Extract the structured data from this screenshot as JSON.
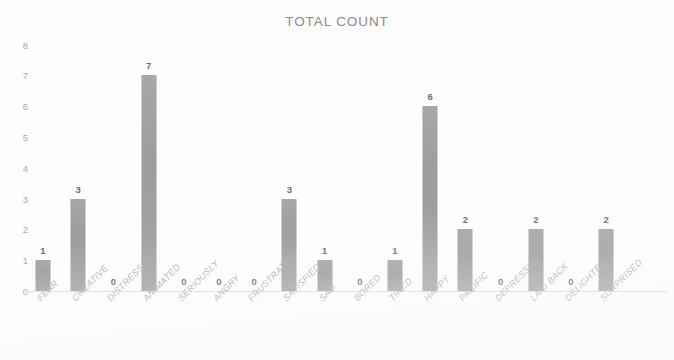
{
  "chart_data": {
    "type": "bar",
    "title": "TOTAL COUNT",
    "xlabel": "",
    "ylabel": "",
    "ylim": [
      0,
      8
    ],
    "yticks": [
      "0",
      "1",
      "2",
      "3",
      "4",
      "5",
      "6",
      "7",
      "8"
    ],
    "grid": false,
    "legend": "none",
    "bar_color": "#a2a2a2",
    "title_color": "#8a8a8a",
    "categories": [
      "FEAR",
      "CREATIVE",
      "DISTRESSED",
      "ANIMATED",
      "SERIOUSLY",
      "ANGRY",
      "FRUSTRATED",
      "SATISFIED",
      "SAD",
      "BORED",
      "TIRED",
      "HAPPY",
      "PACIFIC",
      "DEPRESSED",
      "LAID BACK",
      "DELIGHTED",
      "SURPRISED"
    ],
    "values": [
      1,
      3,
      0,
      7,
      0,
      0,
      0,
      3,
      1,
      0,
      1,
      6,
      2,
      0,
      2,
      0,
      2
    ],
    "data_labels": [
      "1",
      "3",
      "0",
      "7",
      "0",
      "0",
      "0",
      "3",
      "1",
      "0",
      "1",
      "6",
      "2",
      "0",
      "2",
      "0",
      "2"
    ]
  }
}
